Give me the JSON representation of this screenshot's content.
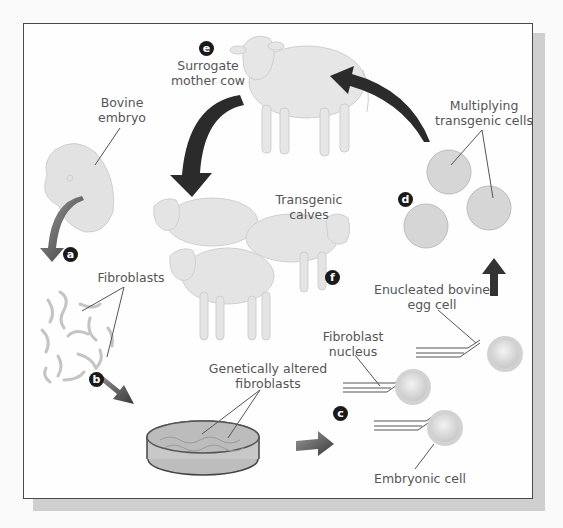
{
  "colors": {
    "frame_border": "#4a4a4a",
    "shadow": "#cfcfcf",
    "label_text": "#555555",
    "step_badge": "#1a1a1a",
    "arrow_dark": "#2b2b2b",
    "arrow_gray": "#8a8a8a",
    "cow_fill": "#e4e4e4",
    "cell_fill": "#d9d9d9"
  },
  "steps": [
    {
      "id": "a",
      "letter": "a"
    },
    {
      "id": "b",
      "letter": "b"
    },
    {
      "id": "c",
      "letter": "c"
    },
    {
      "id": "d",
      "letter": "d"
    },
    {
      "id": "e",
      "letter": "e"
    },
    {
      "id": "f",
      "letter": "f"
    }
  ],
  "labels": {
    "surrogate": "Surrogate\nmother cow",
    "embryo": "Bovine\nembryo",
    "fibroblasts": "Fibroblasts",
    "altered": "Genetically altered\nfibroblasts",
    "calves": "Transgenic calves",
    "multiplying": "Multiplying\ntransgenic cells",
    "enucleated": "Enucleated bovine\negg cell",
    "fib_nucleus": "Fibroblast\nnucleus",
    "embryonic": "Embryonic cell"
  },
  "icons": {
    "cow": "cow-illustration",
    "embryo": "embryo-illustration",
    "fibroblast": "fibroblast-cells",
    "petri": "petri-dish",
    "cell": "cell-circle",
    "pipette": "micropipette",
    "arrow": "process-arrow"
  }
}
